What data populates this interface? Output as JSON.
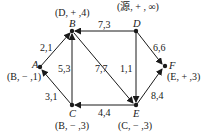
{
  "diagram": {
    "type": "network-flow-labeling",
    "colors": {
      "ink": "#1a1a1a",
      "background": "#ffffff"
    },
    "nodes": {
      "A": {
        "name": "A",
        "label": "(B, − ,1)"
      },
      "B": {
        "name": "B",
        "label": "(D, + ,4)"
      },
      "C": {
        "name": "C",
        "label": "(B, − ,3)"
      },
      "D": {
        "name": "D",
        "label": "(源, + , ∞)"
      },
      "E": {
        "name": "E",
        "label": "(C, − ,3)"
      },
      "F": {
        "name": "F",
        "label": "(E, + ,3)"
      }
    },
    "edges": [
      {
        "from": "B",
        "to": "A",
        "weight": "2,1"
      },
      {
        "from": "A",
        "to": "C",
        "weight": "3,1"
      },
      {
        "from": "C",
        "to": "B",
        "weight": "5,3"
      },
      {
        "from": "D",
        "to": "B",
        "weight": "7,3"
      },
      {
        "from": "B",
        "to": "E",
        "weight": "7,7"
      },
      {
        "from": "D",
        "to": "E",
        "weight": "1,1"
      },
      {
        "from": "D",
        "to": "F",
        "weight": "6,6"
      },
      {
        "from": "E",
        "to": "C",
        "weight": "4,4"
      },
      {
        "from": "E",
        "to": "F",
        "weight": "8,4"
      }
    ]
  }
}
